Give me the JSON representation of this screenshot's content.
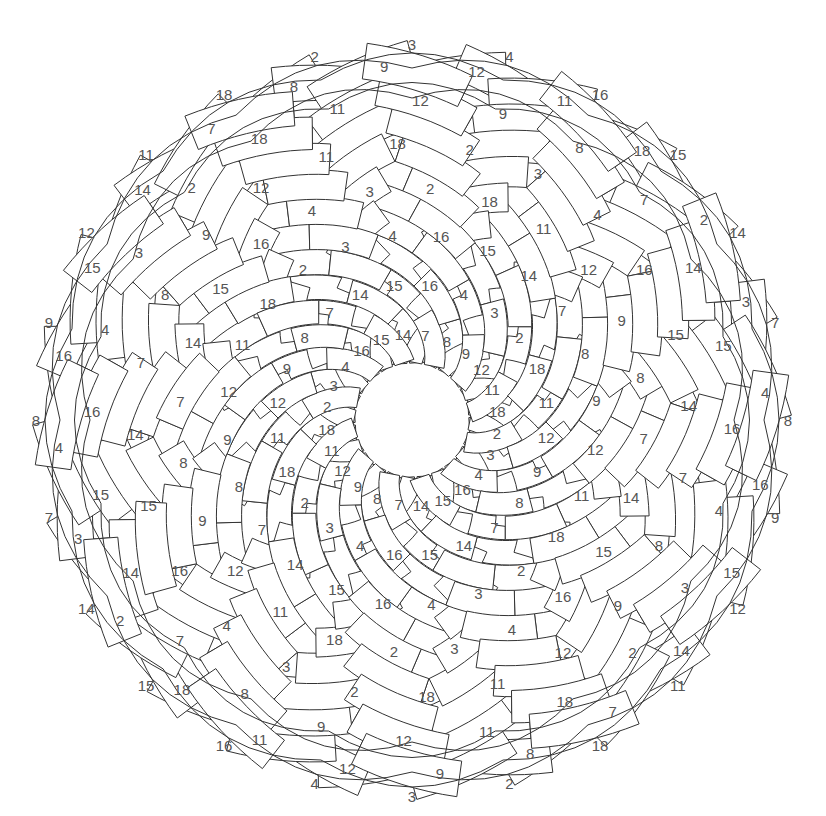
{
  "canvas": {
    "width": 826,
    "height": 816
  },
  "colors": {
    "background": "#ffffff",
    "stroke": "#333333",
    "fill": "#ffffff",
    "label": "#555555"
  },
  "geometry": {
    "center": [
      412,
      420
    ],
    "inner_radius": 58,
    "outer_radius": 362,
    "rim_bulge": 18,
    "strand_count": 24,
    "band_width_inner": 20,
    "band_width_outer": 36,
    "twist_degrees": 150,
    "label_radii": [
      0.06,
      0.2,
      0.36,
      0.52,
      0.68,
      0.84,
      0.97
    ],
    "label_font_size": 15
  },
  "inner_ring_cycle": [
    7,
    8,
    9,
    12,
    11,
    18,
    2,
    3,
    4,
    16,
    15,
    14
  ],
  "strand_numbers_family_a": [
    7,
    8,
    9,
    12,
    11,
    18,
    2,
    3,
    4,
    16,
    15,
    14,
    7,
    8,
    9,
    12,
    11,
    18,
    2,
    3,
    4,
    16,
    15,
    14
  ],
  "strand_numbers_family_b": [
    14,
    15,
    16,
    4,
    3,
    2,
    18,
    11,
    12,
    9,
    8,
    7,
    14,
    15,
    16,
    4,
    3,
    2,
    18,
    11,
    12,
    9,
    8,
    7
  ],
  "outer_rim_labels": [
    "4",
    "16",
    "15",
    "14",
    "7",
    "8",
    "9",
    "12",
    "11",
    "18",
    "2",
    "3",
    "4",
    "16",
    "15",
    "14",
    "7",
    "8",
    "9",
    "12",
    "11",
    "18",
    "2",
    "3"
  ]
}
